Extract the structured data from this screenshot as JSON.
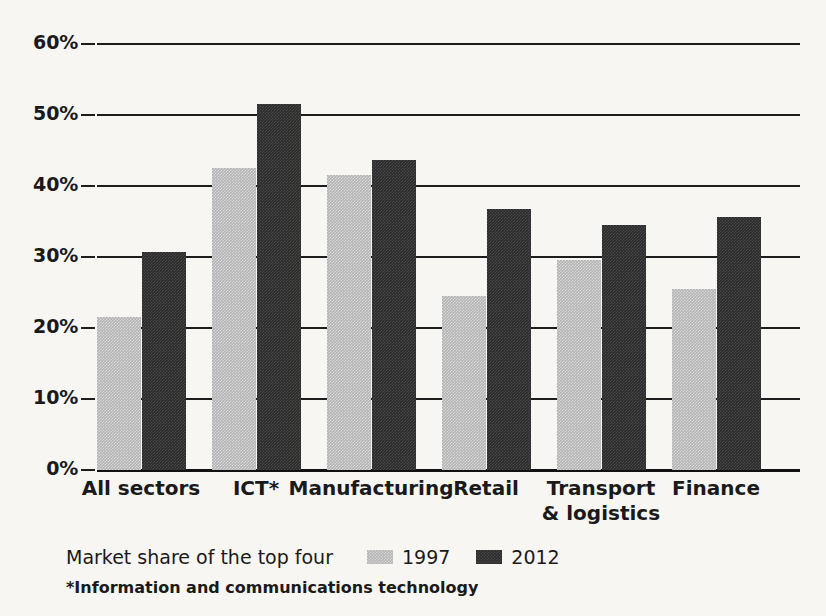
{
  "chart_data": {
    "type": "bar",
    "title": "Market share of the top four",
    "xlabel": "",
    "ylabel": "",
    "ylim": [
      0,
      60
    ],
    "grid": true,
    "legend_position": "bottom",
    "categories": [
      "All sectors",
      "ICT*",
      "Manufacturing",
      "Retail",
      "Transport\n& logistics",
      "Finance"
    ],
    "ytick_labels": [
      "60%",
      "50%",
      "40%",
      "30%",
      "20%",
      "10%",
      "0%"
    ],
    "ytick_values": [
      60,
      50,
      40,
      30,
      20,
      10,
      0
    ],
    "series": [
      {
        "name": "1997",
        "color": "#b3b3b3",
        "values": [
          21.6,
          42.5,
          41.6,
          24.5,
          29.6,
          25.5
        ]
      },
      {
        "name": "2012",
        "color": "#2b2b2b",
        "values": [
          30.7,
          51.5,
          43.7,
          36.7,
          34.5,
          35.6
        ]
      }
    ],
    "annotations": [
      "*Information and communications technology"
    ]
  },
  "chart": {
    "legend_title": "Market share of the top four",
    "footnote": "*Information and communications technology",
    "categories": [
      {
        "line1": "All sectors",
        "line2": ""
      },
      {
        "line1": "ICT*",
        "line2": ""
      },
      {
        "line1": "Manufacturing",
        "line2": ""
      },
      {
        "line1": "Retail",
        "line2": ""
      },
      {
        "line1": "Transport",
        "line2": "& logistics"
      },
      {
        "line1": "Finance",
        "line2": ""
      }
    ],
    "yticks": [
      "60%",
      "50%",
      "40%",
      "30%",
      "20%",
      "10%",
      "0%"
    ],
    "legend": [
      {
        "label": "1997"
      },
      {
        "label": "2012"
      }
    ]
  }
}
